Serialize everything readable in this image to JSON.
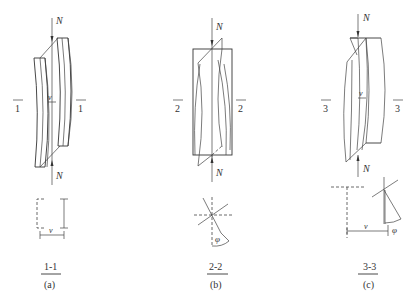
{
  "figure": {
    "panels": [
      {
        "id": "a",
        "caption": "(a)",
        "section_title": "1-1",
        "section_mark_left": "1",
        "section_mark_right": "1",
        "force_top": "N",
        "force_bottom": "N",
        "displacement_label": "v",
        "section_displacement_label": "v",
        "description": "Column under axial load N with lateral (flexural) buckling; cross-section 1-1 shows lateral displacement v"
      },
      {
        "id": "b",
        "caption": "(b)",
        "section_title": "2-2",
        "section_mark_left": "2",
        "section_mark_right": "2",
        "force_top": "N",
        "force_bottom": "N",
        "angle_label": "φ",
        "description": "Column under axial load N with torsional buckling; cross-section 2-2 shows rotation angle φ"
      },
      {
        "id": "c",
        "caption": "(c)",
        "section_title": "3-3",
        "section_mark_left": "3",
        "section_mark_right": "3",
        "force_top": "N",
        "force_bottom": "N",
        "displacement_label": "v",
        "section_displacement_label": "v",
        "angle_label": "φ",
        "description": "Column under axial load N with flexural-torsional buckling; cross-section 3-3 shows displacement v and rotation φ"
      }
    ]
  }
}
